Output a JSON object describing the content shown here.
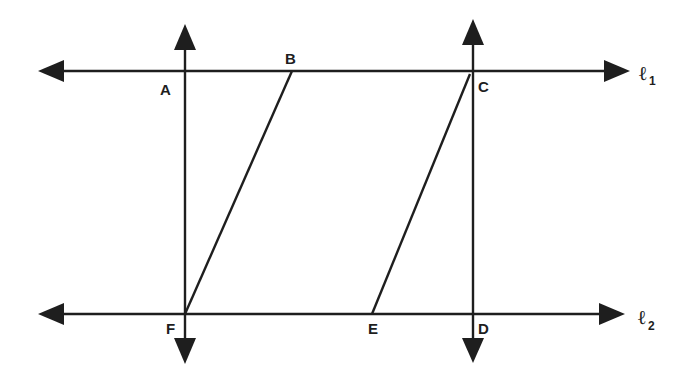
{
  "diagram": {
    "lines": {
      "l1": {
        "label": "ℓ",
        "subscript": "1"
      },
      "l2": {
        "label": "ℓ",
        "subscript": "2"
      }
    },
    "points": {
      "A": "A",
      "B": "B",
      "C": "C",
      "D": "D",
      "E": "E",
      "F": "F"
    },
    "segments": [
      "BF",
      "CE"
    ],
    "perpendicular_lines": [
      "AF",
      "CD"
    ],
    "colors": {
      "ink": "#1e1e1e",
      "background": "#ffffff"
    }
  }
}
